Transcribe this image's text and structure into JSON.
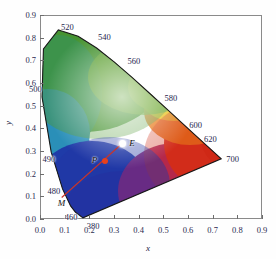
{
  "figure": {
    "type": "cie-chromaticity-diagram",
    "title": "",
    "x_axis": {
      "label": "x",
      "ticks": [
        "0.0",
        "0.1",
        "0.2",
        "0.3",
        "0.4",
        "0.5",
        "0.6",
        "0.7",
        "0.8",
        "0.9"
      ],
      "range": [
        0.0,
        0.9
      ]
    },
    "y_axis": {
      "label": "y",
      "ticks": [
        "0.0",
        "0.1",
        "0.2",
        "0.3",
        "0.4",
        "0.5",
        "0.6",
        "0.7",
        "0.8",
        "0.9"
      ],
      "range": [
        0.0,
        0.9
      ]
    }
  },
  "wavelength_labels": [
    {
      "text": "520",
      "x": 0.085,
      "y": 0.845
    },
    {
      "text": "540",
      "x": 0.235,
      "y": 0.805
    },
    {
      "text": "560",
      "x": 0.355,
      "y": 0.695
    },
    {
      "text": "580",
      "x": 0.505,
      "y": 0.535
    },
    {
      "text": "600",
      "x": 0.605,
      "y": 0.415
    },
    {
      "text": "620",
      "x": 0.665,
      "y": 0.355
    },
    {
      "text": "700",
      "x": 0.755,
      "y": 0.265
    },
    {
      "text": "500",
      "x": -0.045,
      "y": 0.575
    },
    {
      "text": "490",
      "x": 0.01,
      "y": 0.265
    },
    {
      "text": "480",
      "x": 0.03,
      "y": 0.125
    },
    {
      "text": "460",
      "x": 0.1,
      "y": 0.01
    },
    {
      "text": "380",
      "x": 0.19,
      "y": -0.03
    }
  ],
  "points": [
    {
      "name": "E",
      "label": "E",
      "x": 0.333,
      "y": 0.333,
      "color": "#ffffff",
      "kind": "white-point"
    },
    {
      "name": "P",
      "label": "P",
      "x": 0.262,
      "y": 0.255,
      "color": "#e8401c",
      "kind": "sample-point"
    },
    {
      "name": "M",
      "label": "M",
      "x": 0.088,
      "y": 0.095,
      "color": "none",
      "kind": "dominant-wavelength-intersection"
    }
  ],
  "lines": [
    {
      "name": "dominant-wavelength-line",
      "from": "M",
      "to": "E",
      "color": "#c8342a"
    }
  ],
  "chart_data": {
    "type": "scatter",
    "title": "",
    "xlabel": "x",
    "ylabel": "y",
    "xlim": [
      0.0,
      0.9
    ],
    "ylim": [
      0.0,
      0.9
    ],
    "grid": false,
    "legend": "none",
    "spectral_locus": [
      {
        "nm": 380,
        "x": 0.1741,
        "y": 0.005
      },
      {
        "nm": 460,
        "x": 0.144,
        "y": 0.0297
      },
      {
        "nm": 470,
        "x": 0.1241,
        "y": 0.0578
      },
      {
        "nm": 480,
        "x": 0.0913,
        "y": 0.1327
      },
      {
        "nm": 490,
        "x": 0.0454,
        "y": 0.295
      },
      {
        "nm": 500,
        "x": 0.0082,
        "y": 0.5384
      },
      {
        "nm": 510,
        "x": 0.0139,
        "y": 0.7502
      },
      {
        "nm": 520,
        "x": 0.0743,
        "y": 0.8338
      },
      {
        "nm": 530,
        "x": 0.1547,
        "y": 0.8059
      },
      {
        "nm": 540,
        "x": 0.2296,
        "y": 0.7543
      },
      {
        "nm": 550,
        "x": 0.3016,
        "y": 0.6923
      },
      {
        "nm": 560,
        "x": 0.3731,
        "y": 0.6245
      },
      {
        "nm": 570,
        "x": 0.4441,
        "y": 0.5547
      },
      {
        "nm": 580,
        "x": 0.5125,
        "y": 0.4866
      },
      {
        "nm": 590,
        "x": 0.5752,
        "y": 0.4242
      },
      {
        "nm": 600,
        "x": 0.627,
        "y": 0.3725
      },
      {
        "nm": 620,
        "x": 0.6915,
        "y": 0.3083
      },
      {
        "nm": 700,
        "x": 0.7347,
        "y": 0.2653
      }
    ],
    "points": [
      {
        "label": "E",
        "x": 0.333,
        "y": 0.333
      },
      {
        "label": "P",
        "x": 0.262,
        "y": 0.255
      },
      {
        "label": "M",
        "x": 0.088,
        "y": 0.095
      }
    ]
  }
}
